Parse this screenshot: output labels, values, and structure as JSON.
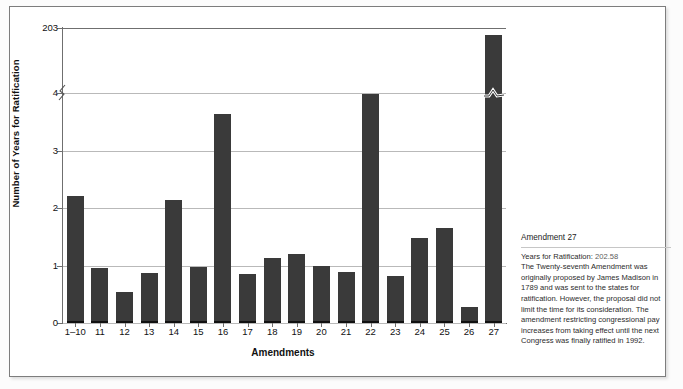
{
  "chart_data": {
    "type": "bar",
    "title": "",
    "xlabel": "Amendments",
    "ylabel": "Number of Years for Ratification",
    "categories": [
      "1–10",
      "11",
      "12",
      "13",
      "14",
      "15",
      "16",
      "17",
      "18",
      "19",
      "20",
      "21",
      "22",
      "23",
      "24",
      "25",
      "26",
      "27"
    ],
    "values": [
      2.17,
      0.93,
      0.5,
      0.84,
      2.1,
      0.94,
      3.6,
      0.82,
      1.1,
      1.17,
      0.95,
      0.86,
      3.94,
      0.78,
      1.44,
      1.61,
      0.25,
      202.58
    ],
    "ytick_labels": [
      "0",
      "1",
      "2",
      "3",
      "4",
      "203"
    ],
    "ytick_values": [
      0,
      1,
      2,
      3,
      4,
      203
    ],
    "ylim": [
      0,
      203
    ],
    "axis_break": {
      "between": [
        4,
        203
      ],
      "label": "axis-break-squiggle"
    },
    "grid": true,
    "legend": "none",
    "bar_color": "#3a3a3a"
  },
  "axis": {
    "y_title": "Number of Years for Ratification",
    "x_title": "Amendments"
  },
  "note": {
    "title": "Amendment 27",
    "value_label": "Years for Ratification:",
    "value": "202.58",
    "body": "The Twenty-seventh Amendment was originally proposed by James Madison in 1789 and was sent to the states for ratification. However, the proposal did not limit the time for its consideration. The amendment restricting congressional pay increases from taking effect until the next Congress was finally ratified in 1992."
  },
  "colors": {
    "bar": "#3a3a3a",
    "grid": "#b9b9b9",
    "axis": "#6f6f6f",
    "frame": "#7d7d7d"
  }
}
